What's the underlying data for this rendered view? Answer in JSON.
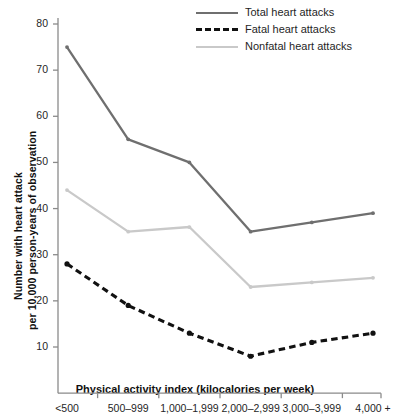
{
  "chart_data": {
    "type": "line",
    "title": "",
    "xlabel": "Physical activity index (kilocalories per week)",
    "ylabel_line1": "Number with heart attack",
    "ylabel_line2": "per 10,000 person-years of observation",
    "categories": [
      "<500",
      "500–999",
      "1,000–1,999",
      "2,000–2,999",
      "3,000–3,999",
      "4,000 +"
    ],
    "ylim": [
      0,
      80
    ],
    "yticks": [
      10,
      20,
      30,
      40,
      50,
      60,
      70,
      80
    ],
    "grid": false,
    "legend_position": "top-right",
    "series": [
      {
        "name": "Total heart attacks",
        "color": "#6f6f6f",
        "style": "solid",
        "values": [
          75,
          55,
          50,
          35,
          37,
          39
        ]
      },
      {
        "name": "Fatal heart attacks",
        "color": "#111111",
        "style": "dashed",
        "values": [
          28,
          19,
          13,
          8,
          11,
          13
        ]
      },
      {
        "name": "Nonfatal heart attacks",
        "color": "#c9c9c9",
        "style": "solid",
        "values": [
          44,
          35,
          36,
          23,
          24,
          25
        ]
      }
    ]
  },
  "axis": {
    "line_color": "#8a8a8a"
  }
}
